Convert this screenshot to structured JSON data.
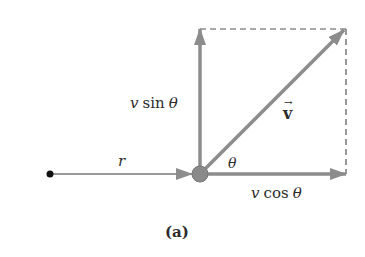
{
  "diagram": {
    "caption": "(a)",
    "labels": {
      "radius": "r",
      "vertical_component": "v sin θ",
      "horizontal_component": "v cos θ",
      "velocity": "v",
      "velocity_arrow_accent": "→",
      "angle": "θ"
    },
    "colors": {
      "arrow": "#8c8c8c",
      "arrow_dark": "#7a7a7a",
      "particle": "#8a8a8a",
      "origin_dot": "#111111",
      "dashed": "#555555",
      "text": "#2b2b2b"
    },
    "geometry": {
      "origin_dot": [
        50,
        174
      ],
      "particle_center": [
        200,
        174
      ],
      "particle_radius": 8,
      "rect_top_right": [
        346,
        29
      ]
    }
  }
}
